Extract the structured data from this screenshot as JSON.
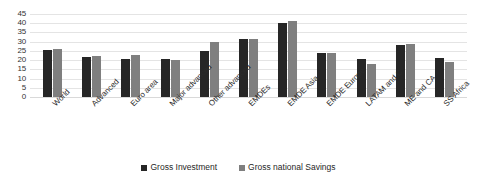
{
  "chart_data": {
    "type": "bar",
    "title": "",
    "subtitle": "",
    "xlabel": "",
    "ylabel": "",
    "ylim": [
      0,
      45
    ],
    "ytick_step": 5,
    "yticks": [
      45,
      40,
      35,
      30,
      25,
      20,
      15,
      10,
      5,
      0
    ],
    "grid": true,
    "legend_position": "bottom",
    "categories": [
      "World",
      "Advanced",
      "Euro area",
      "Major advanced",
      "Other advanced",
      "EMDEs",
      "EMDE Asia",
      "EMDE Europe",
      "LATAM and C",
      "ME and CA",
      "SS Africa"
    ],
    "series": [
      {
        "name": "Gross Investment",
        "color": "#262626",
        "values": [
          25.5,
          21.5,
          20.5,
          20.5,
          25.0,
          31.5,
          40.0,
          24.0,
          20.5,
          28.0,
          21.0
        ]
      },
      {
        "name": "Gross national Savings",
        "color": "#7f7f7f",
        "values": [
          26.0,
          22.0,
          23.0,
          20.0,
          30.0,
          31.5,
          41.0,
          24.0,
          18.0,
          29.0,
          19.0
        ]
      }
    ]
  },
  "legend": {
    "items": [
      {
        "label": "Gross Investment"
      },
      {
        "label": "Gross national Savings"
      }
    ]
  }
}
